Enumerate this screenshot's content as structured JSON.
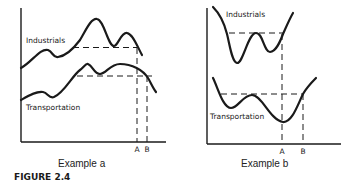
{
  "figure_label": "FIGURE 2.4",
  "panels": [
    {
      "caption": "Example a",
      "series": [
        {
          "name": "Industrials",
          "label": "Industrials"
        },
        {
          "name": "Transportation",
          "label": "Transportation"
        }
      ],
      "x_markers": [
        "A",
        "B"
      ]
    },
    {
      "caption": "Example b",
      "series": [
        {
          "name": "Industrials",
          "label": "Industrials"
        },
        {
          "name": "Transportation",
          "label": "Transportation"
        }
      ],
      "x_markers": [
        "A",
        "B"
      ]
    }
  ],
  "colors": {
    "ink": "#1a1a1a",
    "background": "#ffffff"
  }
}
